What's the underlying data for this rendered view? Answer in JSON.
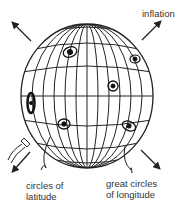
{
  "diagram": {
    "type": "expanding-universe-balloon",
    "labels": {
      "inflation": "inflation",
      "latitude_line1": "circles of",
      "latitude_line2": "latitude",
      "longitude_line1": "great circles",
      "longitude_line2": "of longitude"
    },
    "globe": {
      "cx": 87,
      "cy": 96,
      "rx": 66,
      "ry": 72
    },
    "arrows": [
      "top-left",
      "top-right",
      "bottom-left",
      "bottom-right"
    ],
    "galaxies": 6,
    "colors": {
      "line": "#222222",
      "text": "#333333",
      "background": "#ffffff"
    }
  }
}
